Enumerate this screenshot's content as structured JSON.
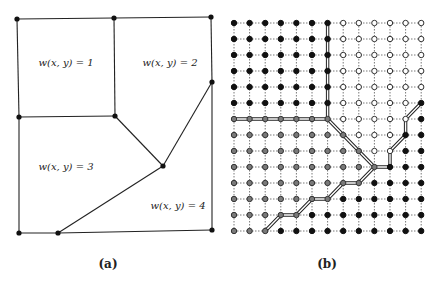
{
  "panel_a": {
    "caption": "(a)",
    "region_labels": [
      {
        "text": "w(x, y) = 1",
        "x": 66,
        "y": 66
      },
      {
        "text": "w(x, y) = 2",
        "x": 170,
        "y": 66
      },
      {
        "text": "w(x, y) = 3",
        "x": 66,
        "y": 170
      },
      {
        "text": "w(x, y) = 4",
        "x": 178,
        "y": 209
      }
    ],
    "vertices": [
      [
        17,
        19
      ],
      [
        114,
        18
      ],
      [
        211,
        17
      ],
      [
        19,
        117
      ],
      [
        115,
        116
      ],
      [
        212,
        82
      ],
      [
        163,
        166
      ],
      [
        19,
        233
      ],
      [
        58,
        233
      ],
      [
        212,
        230
      ]
    ],
    "edges": [
      [
        0,
        1
      ],
      [
        1,
        2
      ],
      [
        2,
        5
      ],
      [
        5,
        9
      ],
      [
        0,
        3
      ],
      [
        3,
        7
      ],
      [
        7,
        8
      ],
      [
        8,
        9
      ],
      [
        1,
        4
      ],
      [
        3,
        4
      ],
      [
        4,
        6
      ],
      [
        6,
        5
      ],
      [
        6,
        8
      ]
    ]
  },
  "panel_b": {
    "caption": "(b)",
    "grid": {
      "cols": 13,
      "rows": 14,
      "x0": 234,
      "y0": 23,
      "dx": 15.6,
      "dy": 16
    },
    "node_types_legend": {
      "B": "black (region 1 / 4)",
      "W": "hollow (region 2)",
      "G": "gray (region 3)"
    },
    "node_rows": [
      "BBBBBBBWWWWWW",
      "BBBBBBBWWWWWW",
      "BBBBBBBWWWWWW",
      "BBBBBBBWWWWWW",
      "BBBBBBBWWWWWW",
      "BBBBBBBWWWWWB",
      "GGGGGGGWWWWWB",
      "GGGGGGGGWWWBB",
      "GGGGGGGGGWWBB",
      "GGGGGGGGGGBBB",
      "GGGGGGGGGBBBB",
      "GGGGGGGBBBBBB",
      "GGGGGBBBBBBBB",
      "GGGBBBBBBBBBB"
    ],
    "cut_paths": [
      {
        "name": "cut-1-3",
        "points": [
          [
            0,
            6
          ],
          [
            6,
            6
          ]
        ]
      },
      {
        "name": "cut-1-2",
        "points": [
          [
            6,
            0
          ],
          [
            6,
            6
          ]
        ]
      },
      {
        "name": "cut-2-3",
        "points": [
          [
            6,
            6
          ],
          [
            9,
            9
          ]
        ]
      },
      {
        "name": "cut-2-4",
        "points": [
          [
            12,
            5
          ],
          [
            11,
            6
          ],
          [
            11,
            7
          ],
          [
            10,
            8
          ],
          [
            10,
            9
          ],
          [
            9,
            9
          ]
        ]
      },
      {
        "name": "cut-3-4",
        "points": [
          [
            9,
            9
          ],
          [
            8,
            10
          ],
          [
            7,
            10
          ],
          [
            6,
            11
          ],
          [
            5,
            11
          ],
          [
            4,
            12
          ],
          [
            3,
            12
          ],
          [
            2,
            13
          ]
        ]
      }
    ]
  },
  "colors": {
    "line": "#222222",
    "black_node": "#111111",
    "gray_node": "#7a7a7a",
    "hollow_fill": "#ffffff",
    "grid": "#555555"
  }
}
